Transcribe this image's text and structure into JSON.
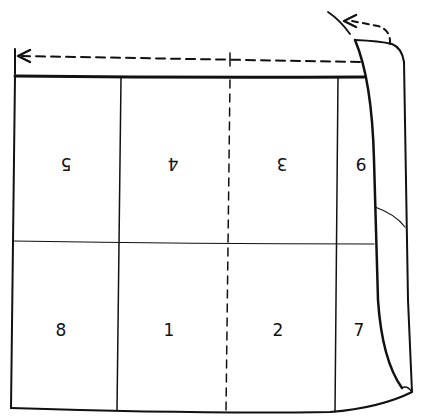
{
  "diagram": {
    "type": "paper-folding-illustration",
    "colors": {
      "ink": "#111111",
      "background": "#ffffff"
    },
    "panels": [
      {
        "label": "5",
        "row": "top",
        "col": 1,
        "rotated": true
      },
      {
        "label": "4",
        "row": "top",
        "col": 2,
        "rotated": true
      },
      {
        "label": "3",
        "row": "top",
        "col": 3,
        "rotated": true
      },
      {
        "label": "9",
        "row": "top",
        "col": 4,
        "rotated": true
      },
      {
        "label": "8",
        "row": "bottom",
        "col": 1,
        "rotated": false
      },
      {
        "label": "1",
        "row": "bottom",
        "col": 2,
        "rotated": false
      },
      {
        "label": "2",
        "row": "bottom",
        "col": 3,
        "rotated": false
      },
      {
        "label": "7",
        "row": "bottom",
        "col": 4,
        "rotated": false
      }
    ],
    "annotations": {
      "fold_line": "dashed vertical center fold",
      "arrow_top": "dashed arrow pointing left across top",
      "arrow_flap": "curved dashed arrow folding flap back"
    }
  }
}
